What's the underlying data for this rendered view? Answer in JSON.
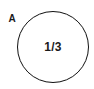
{
  "figure": {
    "part_label": "A",
    "shape": {
      "kind": "circle",
      "fill": "#ffffff",
      "stroke_color": "#111111",
      "stroke_width_px": 1,
      "center_x_px": 53,
      "center_y_px": 47,
      "diameter_px": 72,
      "inner_label": "1/3"
    },
    "background_color": "#ffffff",
    "text_color": "#1a1a1a"
  }
}
